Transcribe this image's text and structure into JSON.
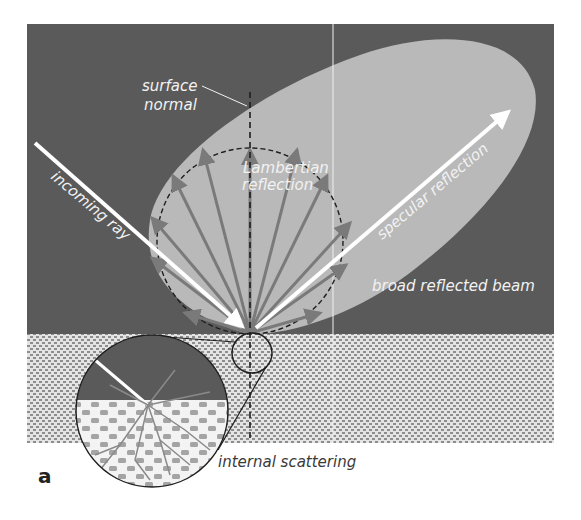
{
  "figure": {
    "panel_label": "a",
    "labels": {
      "surface_normal_line1": "surface",
      "surface_normal_line2": "normal",
      "incoming_ray": "incoming ray",
      "lambertian_line1": "Lambertian",
      "lambertian_line2": "reflection",
      "specular_reflection": "specular reflection",
      "broad_reflected_beam": "broad reflected beam",
      "internal_scattering": "internal scattering"
    },
    "colors": {
      "background_dark": "#5a5a5a",
      "lobe_fill": "#b8b8b8",
      "ray_white": "#ffffff",
      "lambertian_arrows": "#7a7a7a",
      "surface_pattern_light": "#e6e6e6",
      "surface_pattern_dark": "#8c8c8c",
      "outline": "#1e1e1e"
    }
  }
}
